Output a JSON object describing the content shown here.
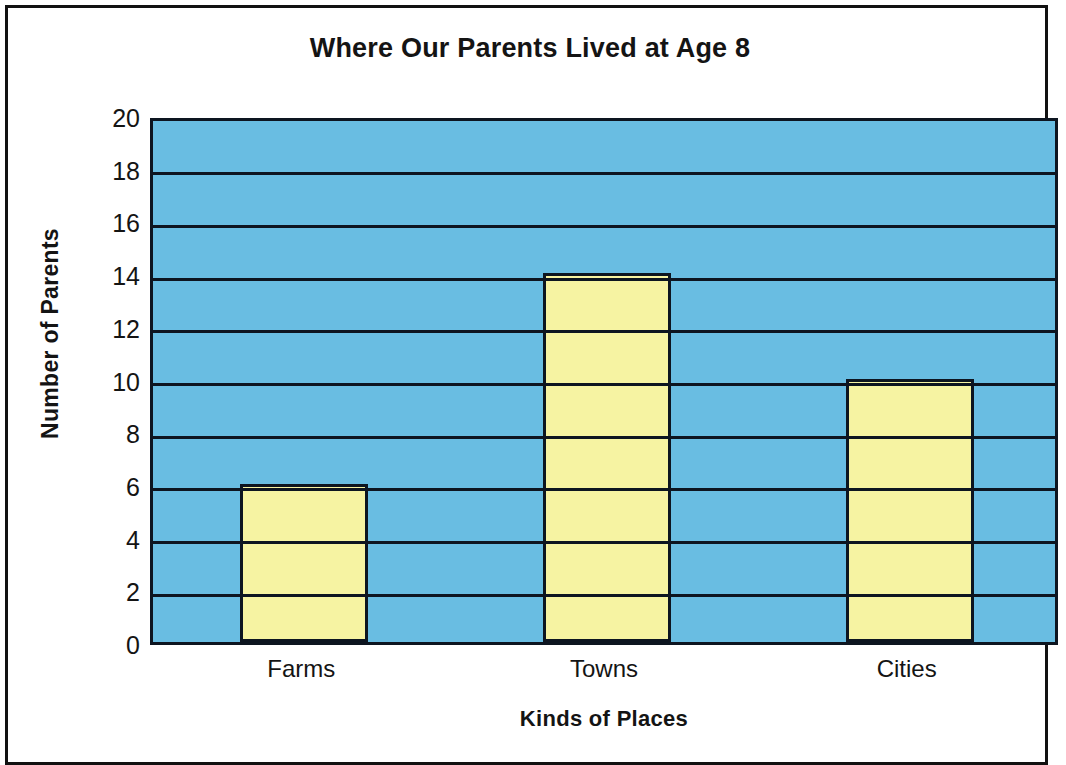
{
  "frame": {
    "border_color": "#111111",
    "background": "#ffffff"
  },
  "chart_data": {
    "type": "bar",
    "title": "Where Our Parents Lived at Age 8",
    "xlabel": "Kinds of Places",
    "ylabel": "Number of Parents",
    "categories": [
      "Farms",
      "Towns",
      "Cities"
    ],
    "values": [
      6,
      14,
      10
    ],
    "ylim": [
      0,
      20
    ],
    "ytick_step": 2,
    "yticks": [
      0,
      2,
      4,
      6,
      8,
      10,
      12,
      14,
      16,
      18,
      20
    ],
    "ytick_labels": [
      "0",
      "2",
      "4",
      "6",
      "8",
      "10",
      "12",
      "14",
      "16",
      "18",
      "20"
    ],
    "grid": true,
    "grid_axis": "y",
    "legend": null,
    "bar_color": "#f6f3a2",
    "bar_edge_color": "#0d1520",
    "plot_background": "#69bde2",
    "gridline_color": "#0d1520",
    "text_color": "#141414"
  }
}
